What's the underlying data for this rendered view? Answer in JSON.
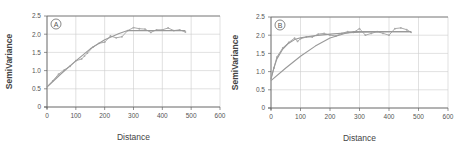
{
  "colors": {
    "axis": "#666666",
    "grid": "#cccccc",
    "empirical": "#aaaaaa",
    "model": "#999999"
  },
  "chart_data": [
    {
      "panel": "A",
      "type": "line",
      "title": "",
      "xlabel": "Distance",
      "ylabel": "SemiVariance",
      "xlim": [
        0,
        600
      ],
      "ylim": [
        0,
        2.5
      ],
      "xticks": [
        "0",
        "100",
        "200",
        "300",
        "400",
        "500",
        "600"
      ],
      "yticks": [
        "0",
        "0.5",
        "1.0",
        "1.5",
        "2.0",
        "2.5"
      ],
      "grid": true,
      "series": [
        {
          "name": "empirical semivariogram",
          "x": [
            0,
            20,
            40,
            60,
            80,
            100,
            120,
            130,
            140,
            160,
            180,
            200,
            220,
            240,
            260,
            280,
            300,
            320,
            340,
            360,
            380,
            400,
            420,
            440,
            460,
            480
          ],
          "y": [
            0.55,
            0.72,
            0.9,
            1.02,
            1.12,
            1.27,
            1.32,
            1.4,
            1.48,
            1.65,
            1.75,
            1.78,
            1.95,
            1.9,
            1.93,
            2.1,
            2.18,
            2.15,
            2.14,
            2.05,
            2.12,
            2.12,
            2.17,
            2.1,
            2.12,
            2.06
          ]
        },
        {
          "name": "fitted model",
          "x": [
            0,
            50,
            100,
            150,
            200,
            250,
            280,
            300,
            350,
            400,
            450,
            480
          ],
          "y": [
            0.55,
            0.92,
            1.27,
            1.6,
            1.85,
            2.02,
            2.1,
            2.1,
            2.1,
            2.1,
            2.1,
            2.1
          ]
        }
      ]
    },
    {
      "panel": "B",
      "type": "line",
      "title": "",
      "xlabel": "Distance",
      "ylabel": "SemiVariance",
      "xlim": [
        0,
        600
      ],
      "ylim": [
        0,
        2.5
      ],
      "xticks": [
        "0",
        "100",
        "200",
        "300",
        "400",
        "500",
        "600"
      ],
      "yticks": [
        "0",
        "0.5",
        "1.0",
        "1.5",
        "2.0",
        "2.5"
      ],
      "grid": true,
      "series": [
        {
          "name": "empirical semivariogram",
          "x": [
            0,
            10,
            20,
            40,
            60,
            80,
            90,
            100,
            120,
            140,
            160,
            180,
            200,
            220,
            240,
            260,
            280,
            300,
            320,
            340,
            360,
            380,
            400,
            420,
            440,
            460,
            475
          ],
          "y": [
            0.8,
            1.1,
            1.4,
            1.65,
            1.8,
            1.92,
            1.83,
            1.9,
            1.95,
            1.95,
            2.03,
            2.05,
            2.0,
            1.98,
            2.05,
            2.1,
            2.08,
            2.18,
            2.0,
            2.05,
            2.1,
            2.05,
            2.0,
            2.18,
            2.2,
            2.15,
            2.08
          ]
        },
        {
          "name": "fitted model (exponential)",
          "x": [
            0,
            10,
            20,
            40,
            60,
            80,
            100,
            150,
            200,
            250,
            300,
            400,
            475
          ],
          "y": [
            0.8,
            1.1,
            1.35,
            1.62,
            1.78,
            1.88,
            1.93,
            1.99,
            2.03,
            2.06,
            2.08,
            2.1,
            2.1
          ]
        },
        {
          "name": "fitted model (gaussian/spherical)",
          "x": [
            0,
            50,
            100,
            150,
            200,
            250,
            280,
            300,
            400,
            475
          ],
          "y": [
            0.75,
            1.1,
            1.42,
            1.7,
            1.92,
            2.05,
            2.1,
            2.1,
            2.1,
            2.1
          ]
        }
      ]
    }
  ]
}
